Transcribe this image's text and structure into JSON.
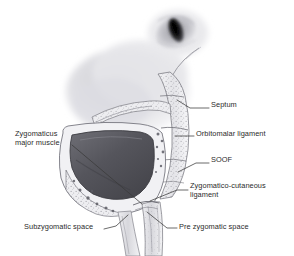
{
  "figure": {
    "background_color": "#ffffff",
    "text_color": "#2b2b2b",
    "leader_color": "#3a3a3a",
    "width": 294,
    "height": 256
  },
  "labels": [
    {
      "id": "septum",
      "text": "Septum",
      "lines": [
        "Septum"
      ],
      "x": 211,
      "y": 104,
      "align": "left"
    },
    {
      "id": "orbitomalar-ligament",
      "text": "Orbitomalar ligament",
      "lines": [
        "Orbitomalar ligament"
      ],
      "x": 196,
      "y": 133,
      "align": "left"
    },
    {
      "id": "soof",
      "text": "SOOF",
      "lines": [
        "SOOF"
      ],
      "x": 211,
      "y": 159,
      "align": "left"
    },
    {
      "id": "zygomatico-cutaneous-ligament",
      "text": "Zygomatico-cutaneous ligament",
      "lines": [
        "Zygomatico-cutaneous",
        "ligament"
      ],
      "x": 190,
      "y": 185,
      "align": "left"
    },
    {
      "id": "pre-zygomatic-space",
      "text": "Pre zygomatic space",
      "lines": [
        "Pre zygomatic space"
      ],
      "x": 179,
      "y": 226,
      "align": "left"
    },
    {
      "id": "subzygomatic-space",
      "text": "Subzygomatic space",
      "lines": [
        "Subzygomatic space"
      ],
      "x": 24,
      "y": 226,
      "align": "left"
    },
    {
      "id": "zygomaticus-major-muscle",
      "text": "Zygomaticus major muscle",
      "lines": [
        "Zygomaticus",
        "major muscle"
      ],
      "x": 15,
      "y": 133,
      "align": "left"
    }
  ],
  "structures": {
    "eye": {
      "name": "eye-globe",
      "iris_color": "#141414",
      "sclera_color": "#c8c8cc"
    },
    "orbital_mass": {
      "name": "upper-orbital-soft-tissue",
      "color": "#d9d9dd"
    },
    "muscle_cavity": {
      "name": "zygomaticus-major-cross-section",
      "color_dark": "#4c4c52",
      "color_light": "#76767c"
    },
    "fat_tissue": {
      "name": "stippled-fat-compartment",
      "color": "#e2e2e5"
    }
  }
}
